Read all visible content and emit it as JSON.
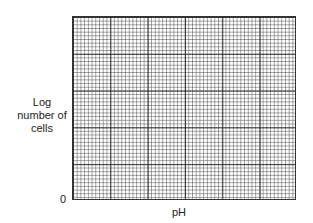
{
  "chart_data": {
    "type": "line",
    "title": "",
    "xlabel": "pH",
    "ylabel": "Log number of cells",
    "y_origin_label": "0",
    "series": [],
    "grid": true
  },
  "labels": {
    "ylabel_line1": "Log",
    "ylabel_line2": "number of",
    "ylabel_line3": "cells",
    "origin": "0",
    "xlabel": "pH"
  }
}
